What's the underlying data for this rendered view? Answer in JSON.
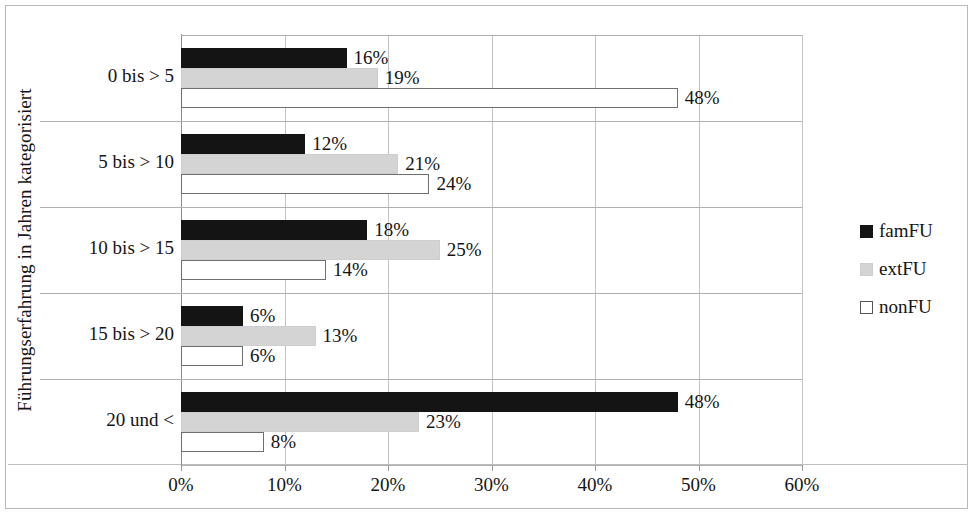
{
  "chart_data": {
    "type": "bar",
    "orientation": "horizontal",
    "title": "",
    "xlabel": "",
    "ylabel": "Führungserfahrung in Jahren kategorisiert",
    "categories": [
      "0 bis > 5",
      "5 bis > 10",
      "10 bis > 15",
      "15 bis > 20",
      "20 und <"
    ],
    "series": [
      {
        "name": "famFU",
        "color": "#141414",
        "values": [
          16,
          12,
          18,
          6,
          48
        ],
        "labels": [
          "16%",
          "12%",
          "18%",
          "6%",
          "48%"
        ]
      },
      {
        "name": "extFU",
        "color": "#d4d4d4",
        "values": [
          19,
          21,
          25,
          13,
          23
        ],
        "labels": [
          "19%",
          "21%",
          "25%",
          "13%",
          "23%"
        ]
      },
      {
        "name": "nonFU",
        "color": "#ffffff",
        "values": [
          48,
          24,
          14,
          6,
          8
        ],
        "labels": [
          "48%",
          "24%",
          "14%",
          "6%",
          "8%"
        ]
      }
    ],
    "xlim": [
      0,
      60
    ],
    "xticks": [
      0,
      10,
      20,
      30,
      40,
      50,
      60
    ],
    "xtick_labels": [
      "0%",
      "10%",
      "20%",
      "30%",
      "40%",
      "50%",
      "60%"
    ],
    "grid": true,
    "legend_position": "right"
  },
  "legend": {
    "items": [
      {
        "label": "famFU"
      },
      {
        "label": "extFU"
      },
      {
        "label": "nonFU"
      }
    ]
  }
}
